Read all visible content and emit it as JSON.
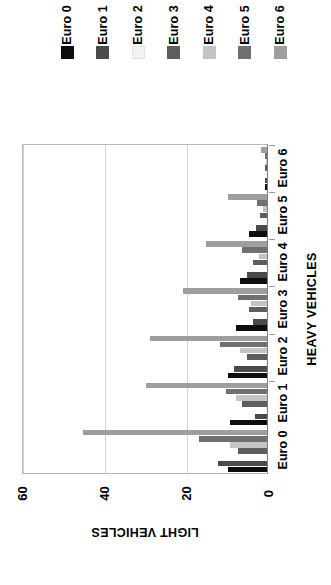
{
  "legend": {
    "position": "top",
    "entries": [
      {
        "label": "Euro 0",
        "color": "#0d0d0d"
      },
      {
        "label": "Euro 1",
        "color": "#4a4a4a"
      },
      {
        "label": "Euro 2",
        "color": "#f2f2f2"
      },
      {
        "label": "Euro 3",
        "color": "#5e5e5e"
      },
      {
        "label": "Euro 4",
        "color": "#c4c4c4"
      },
      {
        "label": "Euro 5",
        "color": "#707070"
      },
      {
        "label": "Euro 6",
        "color": "#9e9e9e"
      }
    ]
  },
  "axes": {
    "category_axis_title": "HEAVY VEHICLES",
    "value_axis_title": "LIGHT VEHICLES",
    "value_ticks": [
      "0",
      "20",
      "40",
      "60"
    ],
    "value_tick_values": [
      0,
      20,
      40,
      60
    ],
    "category_ticks": [
      "Euro 0",
      "Euro 1",
      "Euro 2",
      "Euro 3",
      "Euro 4",
      "Euro 5",
      "Euro 6"
    ]
  },
  "chart_data": {
    "type": "bar",
    "orientation": "horizontal",
    "rotated_degrees": 90,
    "title": "",
    "xlabel": "HEAVY VEHICLES",
    "ylabel": "LIGHT VEHICLES",
    "ylim": [
      0,
      60
    ],
    "grid": true,
    "grid_axis": "value",
    "legend_position": "top",
    "categories": [
      "Euro 0",
      "Euro 1",
      "Euro 2",
      "Euro 3",
      "Euro 4",
      "Euro 5",
      "Euro 6"
    ],
    "series": [
      {
        "name": "Euro 0",
        "color": "#0d0d0d",
        "values": [
          9.5,
          9.0,
          9.5,
          7.5,
          6.5,
          4.5,
          0.6
        ]
      },
      {
        "name": "Euro 1",
        "color": "#4a4a4a",
        "values": [
          12.0,
          3.0,
          8.0,
          3.5,
          5.0,
          2.8,
          0.4
        ]
      },
      {
        "name": "Euro 2",
        "color": "#f2f2f2",
        "values": [
          0.3,
          0.3,
          0.3,
          0.3,
          0.3,
          0.3,
          0.2
        ]
      },
      {
        "name": "Euro 3",
        "color": "#5e5e5e",
        "values": [
          7.0,
          6.0,
          5.0,
          4.5,
          3.5,
          1.8,
          0.4
        ]
      },
      {
        "name": "Euro 4",
        "color": "#c4c4c4",
        "values": [
          9.0,
          7.5,
          6.5,
          4.0,
          2.0,
          1.0,
          0.3
        ]
      },
      {
        "name": "Euro 5",
        "color": "#707070",
        "values": [
          16.5,
          10.0,
          11.5,
          7.0,
          6.0,
          2.5,
          0.5
        ]
      },
      {
        "name": "Euro 6",
        "color": "#9e9e9e",
        "values": [
          45.0,
          29.5,
          28.5,
          20.5,
          15.0,
          9.5,
          1.5
        ]
      }
    ]
  }
}
